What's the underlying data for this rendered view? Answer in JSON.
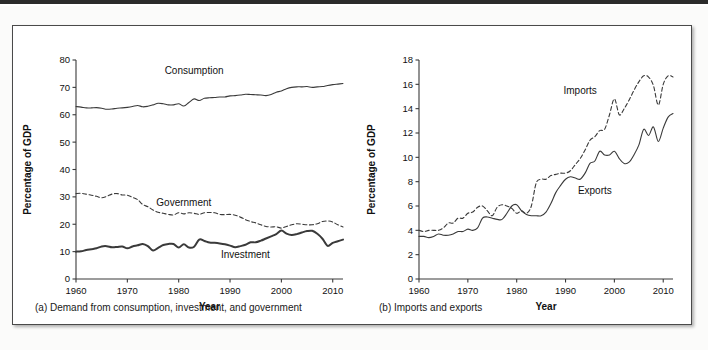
{
  "figure": {
    "background": "#ffffff",
    "frame_border_color": "#4a4a4a",
    "line_color": "#3a3a3a"
  },
  "panels": [
    {
      "id": "a",
      "caption": "(a) Demand from consumption, investment, and government"
    },
    {
      "id": "b",
      "caption": "(b) Imports and exports"
    }
  ],
  "chart_data": [
    {
      "type": "line",
      "panel": "a",
      "title": "",
      "caption": "(a) Demand from consumption, investment, and government",
      "xlabel": "Year",
      "ylabel": "Percentage of GDP",
      "xlim": [
        1960,
        2012
      ],
      "ylim": [
        0,
        80
      ],
      "xticks": [
        1960,
        1970,
        1980,
        1990,
        2000,
        2010
      ],
      "yticks": [
        0,
        10,
        20,
        30,
        40,
        50,
        60,
        70,
        80
      ],
      "grid": false,
      "legend": "inline-labels",
      "annotations": [
        {
          "text": "Consumption",
          "x": 1983,
          "y": 75
        },
        {
          "text": "Government",
          "x": 1981,
          "y": 26.5
        },
        {
          "text": "Investment",
          "x": 1993,
          "y": 7.5
        }
      ],
      "x": [
        1960,
        1961,
        1962,
        1963,
        1964,
        1965,
        1966,
        1967,
        1968,
        1969,
        1970,
        1971,
        1972,
        1973,
        1974,
        1975,
        1976,
        1977,
        1978,
        1979,
        1980,
        1981,
        1982,
        1983,
        1984,
        1985,
        1986,
        1987,
        1988,
        1989,
        1990,
        1991,
        1992,
        1993,
        1994,
        1995,
        1996,
        1997,
        1998,
        1999,
        2000,
        2001,
        2002,
        2003,
        2004,
        2005,
        2006,
        2007,
        2008,
        2009,
        2010,
        2011,
        2012
      ],
      "series": [
        {
          "name": "Consumption",
          "style": "solid",
          "width": 1.1,
          "values": [
            63.0,
            62.8,
            62.5,
            62.5,
            62.6,
            62.4,
            62.0,
            62.1,
            62.4,
            62.5,
            62.7,
            63.0,
            63.4,
            62.9,
            63.1,
            63.6,
            64.2,
            64.0,
            63.6,
            63.6,
            64.0,
            63.2,
            64.5,
            65.8,
            65.2,
            66.0,
            66.2,
            66.3,
            66.5,
            66.5,
            66.9,
            67.0,
            67.2,
            67.5,
            67.4,
            67.3,
            67.2,
            67.0,
            67.4,
            68.2,
            68.7,
            69.5,
            70.0,
            70.2,
            70.2,
            70.3,
            70.0,
            70.2,
            70.3,
            70.7,
            71.0,
            71.2,
            71.4
          ]
        },
        {
          "name": "Government",
          "style": "dashed",
          "width": 1.1,
          "values": [
            31.2,
            31.3,
            31.0,
            30.6,
            30.2,
            29.7,
            30.2,
            31.0,
            31.2,
            30.7,
            30.6,
            29.8,
            29.0,
            27.2,
            26.4,
            25.2,
            24.4,
            24.0,
            23.6,
            23.4,
            24.2,
            23.8,
            24.2,
            24.0,
            23.6,
            24.2,
            24.3,
            24.2,
            23.6,
            23.5,
            23.6,
            23.3,
            22.6,
            21.7,
            21.0,
            20.5,
            19.8,
            19.2,
            19.0,
            19.1,
            18.6,
            19.2,
            19.8,
            20.2,
            20.0,
            19.8,
            19.8,
            20.2,
            21.0,
            21.2,
            20.8,
            19.8,
            19.0
          ]
        },
        {
          "name": "Investment",
          "style": "solid",
          "width": 2.0,
          "values": [
            10.0,
            10.1,
            10.6,
            10.9,
            11.2,
            11.9,
            12.0,
            11.6,
            11.7,
            11.9,
            11.2,
            11.9,
            12.3,
            12.8,
            12.0,
            10.4,
            11.4,
            12.4,
            12.8,
            12.8,
            11.5,
            12.7,
            11.5,
            11.8,
            14.4,
            13.9,
            13.3,
            13.2,
            13.0,
            12.7,
            12.2,
            11.6,
            12.0,
            12.5,
            13.4,
            13.4,
            14.0,
            14.8,
            15.6,
            16.4,
            17.7,
            16.6,
            16.1,
            16.4,
            17.0,
            17.5,
            17.6,
            16.5,
            14.7,
            12.1,
            13.2,
            13.8,
            14.4
          ]
        }
      ]
    },
    {
      "type": "line",
      "panel": "b",
      "title": "",
      "caption": "(b) Imports and exports",
      "xlabel": "Year",
      "ylabel": "Percentage of GDP",
      "xlim": [
        1960,
        2012
      ],
      "ylim": [
        0,
        18
      ],
      "xticks": [
        1960,
        1970,
        1980,
        1990,
        2000,
        2010
      ],
      "yticks": [
        0,
        2,
        4,
        6,
        8,
        10,
        12,
        14,
        16,
        18
      ],
      "grid": false,
      "legend": "inline-labels",
      "annotations": [
        {
          "text": "Imports",
          "x": 1993,
          "y": 15.2
        },
        {
          "text": "Exports",
          "x": 1996,
          "y": 7.0
        }
      ],
      "x": [
        1960,
        1961,
        1962,
        1963,
        1964,
        1965,
        1966,
        1967,
        1968,
        1969,
        1970,
        1971,
        1972,
        1973,
        1974,
        1975,
        1976,
        1977,
        1978,
        1979,
        1980,
        1981,
        1982,
        1983,
        1984,
        1985,
        1986,
        1987,
        1988,
        1989,
        1990,
        1991,
        1992,
        1993,
        1994,
        1995,
        1996,
        1997,
        1998,
        1999,
        2000,
        2001,
        2002,
        2003,
        2004,
        2005,
        2006,
        2007,
        2008,
        2009,
        2010,
        2011,
        2012
      ],
      "series": [
        {
          "name": "Imports",
          "style": "dashed",
          "width": 1.1,
          "values": [
            4.0,
            3.9,
            4.0,
            4.0,
            4.0,
            4.2,
            4.6,
            4.6,
            5.0,
            5.0,
            5.4,
            5.5,
            5.9,
            6.0,
            5.6,
            5.2,
            5.9,
            6.1,
            6.0,
            5.8,
            5.4,
            5.6,
            5.4,
            6.0,
            7.9,
            8.2,
            8.2,
            8.5,
            8.6,
            8.7,
            8.7,
            8.9,
            9.4,
            9.9,
            10.6,
            11.4,
            11.7,
            12.2,
            12.3,
            13.5,
            14.8,
            13.5,
            14.0,
            14.7,
            15.5,
            16.2,
            16.7,
            16.6,
            15.9,
            14.3,
            16.0,
            16.7,
            16.6
          ]
        },
        {
          "name": "Exports",
          "style": "solid",
          "width": 1.1,
          "values": [
            3.5,
            3.5,
            3.4,
            3.5,
            3.7,
            3.6,
            3.6,
            3.7,
            3.9,
            3.9,
            4.1,
            4.0,
            4.2,
            5.0,
            5.1,
            5.0,
            4.9,
            4.9,
            5.4,
            6.0,
            6.1,
            5.6,
            5.3,
            5.2,
            5.2,
            5.2,
            5.5,
            6.2,
            7.1,
            7.7,
            8.2,
            8.4,
            8.3,
            8.2,
            8.7,
            9.5,
            9.7,
            10.5,
            10.2,
            10.2,
            10.5,
            9.9,
            9.5,
            9.6,
            10.2,
            11.0,
            12.3,
            11.8,
            12.5,
            11.3,
            12.4,
            13.3,
            13.6
          ]
        }
      ]
    }
  ]
}
